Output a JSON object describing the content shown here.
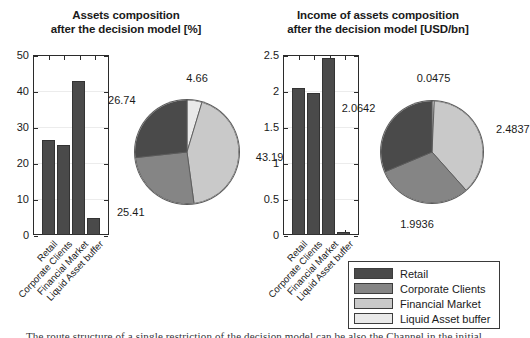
{
  "figure": {
    "background": "#ffffff",
    "caption_partial": "The route structure of a single restriction of the decision model can be also the Channel in the initial"
  },
  "palette": {
    "retail": "#4a4a4a",
    "corporate_clients": "#858585",
    "financial_market": "#c9c9c9",
    "liquid_asset_buffer": "#e9e9e9",
    "axis": "#2b2b2b",
    "text": "#1a1a1a"
  },
  "legend": {
    "name": "series-legend",
    "items": [
      {
        "label": "Retail",
        "color": "#4a4a4a"
      },
      {
        "label": "Corporate Clients",
        "color": "#858585"
      },
      {
        "label": "Financial Market",
        "color": "#c9c9c9"
      },
      {
        "label": "Liquid Asset buffer",
        "color": "#e9e9e9"
      }
    ]
  },
  "panels": [
    {
      "id": "assets-composition",
      "title_line1": "Assets composition",
      "title_line2": "after the decision model [%]"
    },
    {
      "id": "income-of-assets-composition",
      "title_line1": "Income of assets composition",
      "title_line2": "after the decision model [USD/bn]"
    }
  ],
  "chart_data": [
    {
      "type": "bar",
      "id": "assets-composition-bar",
      "title": "Assets composition after the decision model [%]",
      "categories": [
        "Retail",
        "Corporate Clients",
        "Financial Market",
        "Liquid Asset buffer"
      ],
      "values": [
        26.74,
        25.41,
        43.19,
        4.66
      ],
      "xlabel": "",
      "ylabel": "",
      "ylim": [
        0,
        50
      ],
      "yticks": [
        0,
        10,
        20,
        30,
        40,
        50
      ],
      "ytick_labels": [
        "0",
        "10",
        "20",
        "30",
        "40",
        "50"
      ],
      "grid": true,
      "bar_color": "#4a4a4a"
    },
    {
      "type": "pie",
      "id": "assets-composition-pie",
      "title": "Assets composition after the decision model [%]",
      "labels": [
        "Liquid Asset buffer",
        "Financial Market",
        "Corporate Clients",
        "Retail"
      ],
      "values": [
        4.66,
        43.19,
        25.41,
        26.74
      ],
      "data_labels": [
        "4.66",
        "43.19",
        "25.41",
        "26.74"
      ],
      "colors": [
        "#e9e9e9",
        "#c9c9c9",
        "#858585",
        "#4a4a4a"
      ],
      "start_angle_deg": 0,
      "direction": "clockwise",
      "legend_position": "bottom-right"
    },
    {
      "type": "bar",
      "id": "income-of-assets-bar",
      "title": "Income of assets composition after the decision model [USD/bn]",
      "categories": [
        "Retail",
        "Corporate Clients",
        "Financial Market",
        "Liquid Asset buffer"
      ],
      "values": [
        2.0642,
        1.9936,
        2.4837,
        0.0475
      ],
      "xlabel": "",
      "ylabel": "",
      "ylim": [
        0,
        2.5
      ],
      "yticks": [
        0,
        0.5,
        1,
        1.5,
        2,
        2.5
      ],
      "ytick_labels": [
        "0",
        "0.5",
        "1",
        "1.5",
        "2",
        "2.5"
      ],
      "grid": true,
      "bar_color": "#4a4a4a"
    },
    {
      "type": "pie",
      "id": "income-of-assets-pie",
      "title": "Income of assets composition after the decision model [USD/bn]",
      "labels": [
        "Liquid Asset buffer",
        "Financial Market",
        "Corporate Clients",
        "Retail"
      ],
      "values": [
        0.0475,
        2.4837,
        1.9936,
        2.0642
      ],
      "data_labels": [
        "0.0475",
        "2.4837",
        "1.9936",
        "2.0642"
      ],
      "colors": [
        "#e9e9e9",
        "#c9c9c9",
        "#858585",
        "#4a4a4a"
      ],
      "start_angle_deg": 0,
      "direction": "clockwise",
      "legend_position": "bottom-right"
    }
  ]
}
